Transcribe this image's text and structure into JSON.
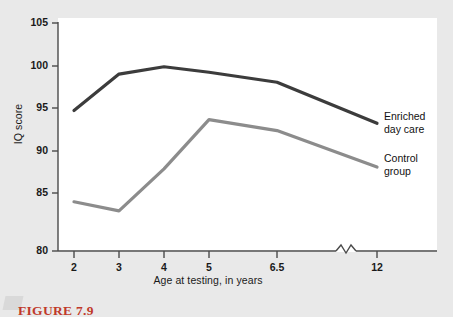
{
  "figure": {
    "caption": "FIGURE 7.9"
  },
  "chart_data": {
    "type": "line",
    "title": "",
    "xlabel": "Age at testing, in years",
    "ylabel": "IQ score",
    "categories": [
      "2",
      "3",
      "4",
      "5",
      "6.5",
      "12"
    ],
    "x_tick_labels": [
      "2",
      "3",
      "4",
      "5",
      "6.5",
      "12"
    ],
    "y_tick_labels": [
      "105",
      "100",
      "95",
      "90",
      "85",
      "80"
    ],
    "ylim": [
      80,
      105
    ],
    "y_tick_step": 5,
    "grid": false,
    "legend_position": "right-inline",
    "axis_break": {
      "present": true,
      "between": [
        "6.5",
        "12"
      ],
      "style": "zigzag"
    },
    "series": [
      {
        "name": "Enriched day care",
        "label_text": "Enriched\nday care",
        "color": "#3c3c3c",
        "values": [
          95.4,
          99.4,
          100.2,
          99.6,
          98.5,
          94.0
        ]
      },
      {
        "name": "Control group",
        "label_text": "Control\ngroup",
        "color": "#8c8c8c",
        "values": [
          85.4,
          84.4,
          89.0,
          94.4,
          93.2,
          89.2
        ]
      }
    ]
  },
  "colors": {
    "page_background": "#e9e9e9",
    "plot_background": "#ffffff",
    "axis": "#4a4a4a",
    "text": "#1a1a1a",
    "caption": "#c0392b"
  }
}
